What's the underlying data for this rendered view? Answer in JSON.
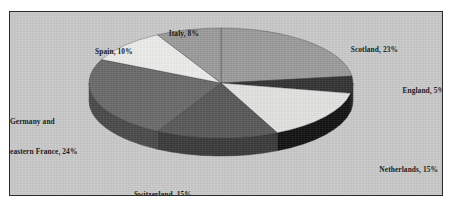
{
  "chart_data": {
    "type": "pie",
    "title": "",
    "subtitle": "",
    "xlabel": "",
    "ylabel": "",
    "legend_position": "none",
    "grid": false,
    "three_d": true,
    "start_angle_deg": 0,
    "direction": "clockwise",
    "categories": [
      "Scotland",
      "England",
      "Netherlands",
      "Switzerland",
      "Germany and eastern France",
      "Spain",
      "Italy"
    ],
    "values": [
      23,
      5,
      15,
      15,
      24,
      10,
      8
    ],
    "unit": "%",
    "slices": [
      {
        "name": "Scotland",
        "value": 23,
        "label": "Scotland, 23%",
        "color": "#9a9a9a",
        "side_color": "#7d7d7d"
      },
      {
        "name": "England",
        "value": 5,
        "label": "England, 5%",
        "color": "#333333",
        "side_color": "#242424"
      },
      {
        "name": "Netherlands",
        "value": 15,
        "label": "Netherlands, 15%",
        "color": "#e2e2e0",
        "side_color": "#121212"
      },
      {
        "name": "Switzerland",
        "value": 15,
        "label": "Switzerland, 15%",
        "color": "#585858",
        "side_color": "#3a3a3a"
      },
      {
        "name": "Germany and eastern France",
        "value": 24,
        "label_line1": "Germany and",
        "label_line2": "eastern France, 24%",
        "label": "Germany and eastern France, 24%",
        "color": "#6a6a6a",
        "side_color": "#4a4a4a"
      },
      {
        "name": "Spain",
        "value": 10,
        "label": "Spain, 10%",
        "color": "#ececeb",
        "side_color": "#bdbdbd"
      },
      {
        "name": "Italy",
        "value": 8,
        "label": "Italy, 8%",
        "color": "#9a9a9a",
        "side_color": "#7d7d7d"
      }
    ],
    "colors": {
      "plot_background": "#c9c9c9",
      "frame_border": "#2a2a2a",
      "page_background": "#ffffff",
      "label_text": "#1d1d1d"
    }
  }
}
